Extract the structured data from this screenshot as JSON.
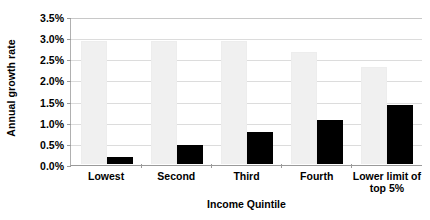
{
  "chart_data": {
    "type": "bar",
    "title": "",
    "subtitle": "",
    "xlabel": "Income Quintile",
    "ylabel": "Annual growth rate",
    "categories": [
      "Lowest",
      "Second",
      "Third",
      "Fourth",
      "Lower limit of top 5%"
    ],
    "category_lines": [
      [
        "Lowest"
      ],
      [
        "Second"
      ],
      [
        "Third"
      ],
      [
        "Fourth"
      ],
      [
        "Lower limit of",
        "top 5%"
      ]
    ],
    "series": [
      {
        "name": "light",
        "color": "#F0F0F0",
        "values": [
          2.9,
          2.9,
          2.9,
          2.65,
          2.3
        ]
      },
      {
        "name": "dark",
        "color": "#000000",
        "values": [
          0.17,
          0.45,
          0.75,
          1.05,
          1.4
        ]
      }
    ],
    "ylim": [
      0,
      3.5
    ],
    "ytick_values": [
      3.5,
      3.0,
      2.5,
      2.0,
      1.5,
      1.0,
      0.5,
      0.0
    ],
    "ytick_labels": [
      "3.5%",
      "3.0%",
      "2.5%",
      "2.0%",
      "1.5%",
      "1.0%",
      "0.5%",
      "0.0%"
    ],
    "grid": true,
    "legend": "none"
  }
}
